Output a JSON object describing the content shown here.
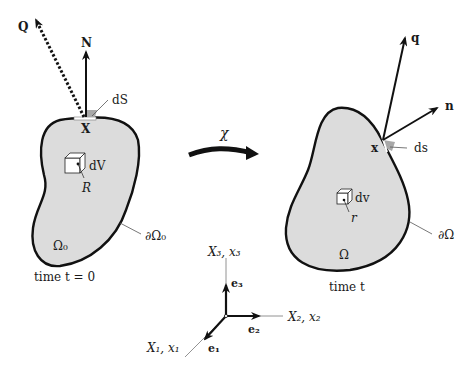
{
  "reference_config": {
    "vector_Q": "Q",
    "vector_N": "N",
    "surface_element": "dS",
    "point": "X",
    "volume_element": "dV",
    "volume_point": "R",
    "region": "Ω₀",
    "boundary": "∂Ω₀",
    "time_label": "time t = 0"
  },
  "mapping": {
    "label": "χ"
  },
  "current_config": {
    "vector_q": "q",
    "vector_n": "n",
    "surface_element": "ds",
    "point": "x",
    "volume_element": "dv",
    "volume_point": "r",
    "region": "Ω",
    "boundary": "∂Ω",
    "time_label": "time t"
  },
  "axes": {
    "x3_label": "X₃, x₃",
    "x2_label": "X₂, x₂",
    "x1_label": "X₁, x₁",
    "e3": "e₃",
    "e2": "e₂",
    "e1": "e₁"
  },
  "colors": {
    "region_fill": "#dcdcdc",
    "stroke": "#111111",
    "patch": "#a8a8a8"
  }
}
